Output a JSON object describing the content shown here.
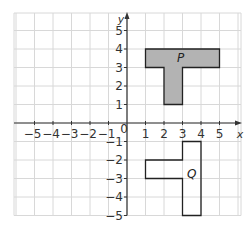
{
  "grid": {
    "x_min": -6,
    "x_max": 6,
    "y_min": -5,
    "y_max": 5,
    "x_ticks": [
      -5,
      -4,
      -3,
      -2,
      -1,
      1,
      2,
      3,
      4,
      5
    ],
    "y_ticks": [
      5,
      4,
      3,
      2,
      1,
      -1,
      -2,
      -3,
      -4,
      -5
    ],
    "x_label": "x",
    "y_label": "y",
    "origin_label": "0",
    "grid_color": "#d8d8d8",
    "axis_color": "#333333"
  },
  "shapes": [
    {
      "name": "P",
      "label": "P",
      "fill": "#b3b3b3",
      "stroke": "#222222",
      "vertices": [
        [
          1,
          4
        ],
        [
          5,
          4
        ],
        [
          5,
          3
        ],
        [
          3,
          3
        ],
        [
          3,
          1
        ],
        [
          2,
          1
        ],
        [
          2,
          3
        ],
        [
          1,
          3
        ]
      ],
      "label_pos": [
        2.9,
        3.5
      ]
    },
    {
      "name": "Q",
      "label": "Q",
      "fill": "none",
      "stroke": "#222222",
      "vertices": [
        [
          3,
          -1
        ],
        [
          4,
          -1
        ],
        [
          4,
          -5
        ],
        [
          3,
          -5
        ],
        [
          3,
          -3
        ],
        [
          1,
          -3
        ],
        [
          1,
          -2
        ],
        [
          3,
          -2
        ]
      ],
      "label_pos": [
        3.5,
        -2.75
      ]
    }
  ]
}
